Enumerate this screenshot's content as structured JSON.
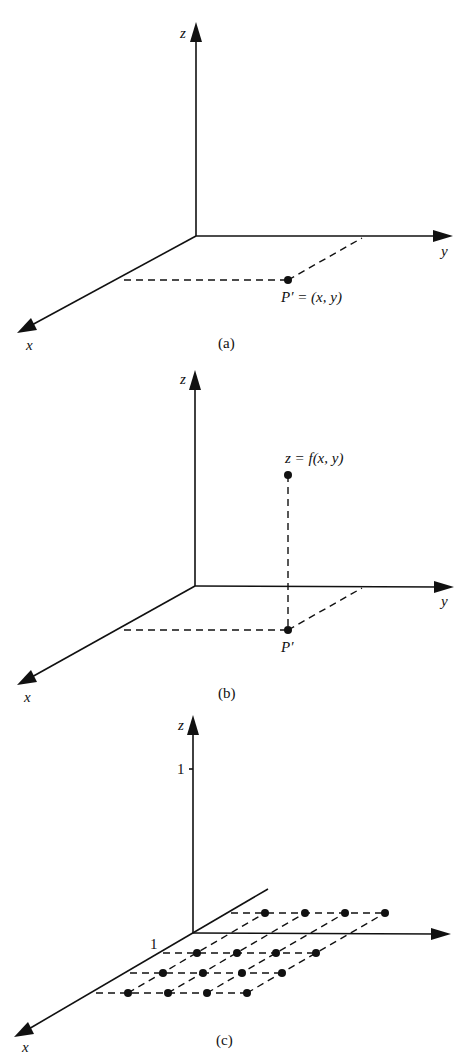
{
  "figure": {
    "panel_a": {
      "caption": "(a)",
      "axis_labels": {
        "x": "x",
        "y": "y",
        "z": "z"
      },
      "point_label": "P′ = (x, y)"
    },
    "panel_b": {
      "caption": "(b)",
      "axis_labels": {
        "x": "x",
        "y": "y",
        "z": "z"
      },
      "surface_point_label": "z = f(x, y)",
      "base_point_label": "P′"
    },
    "panel_c": {
      "caption": "(c)",
      "axis_labels": {
        "x": "x",
        "z": "z"
      },
      "z_tick": "1",
      "x_tick": "1",
      "grid": {
        "rows": 4,
        "cols": 4
      }
    }
  },
  "colors": {
    "ink": "#111111",
    "background": "#ffffff"
  }
}
